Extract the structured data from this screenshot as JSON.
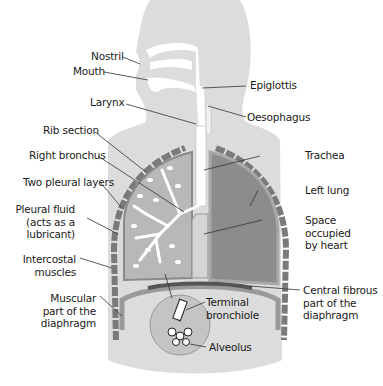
{
  "diagram": {
    "colors": {
      "body_silhouette": "#dcdcdc",
      "airway": "#ffffff",
      "right_lung_tissue": "#b8b8b8",
      "left_lung": "#8c8c8c",
      "pleura": "#a8a8a8",
      "rib": "#7a7a7a",
      "diaphragm_muscle": "#9a9a9a",
      "diaphragm_central": "#555555",
      "alveolus_circle": "#c4c4c4",
      "text": "#1a1a1a",
      "leader_line": "#333333"
    },
    "labels": {
      "nostril": "Nostril",
      "mouth": "Mouth",
      "epiglottis": "Epiglottis",
      "larynx": "Larynx",
      "oesophagus": "Oesophagus",
      "rib_section": "Rib section",
      "trachea": "Trachea",
      "right_bronchus": "Right bronchus",
      "two_pleural_layers": "Two pleural layers",
      "left_lung": "Left lung",
      "pleural_fluid_1": "Pleural fluid",
      "pleural_fluid_2": "(acts as a",
      "pleural_fluid_3": "lubricant)",
      "space_heart_1": "Space",
      "space_heart_2": "occupied",
      "space_heart_3": "by heart",
      "intercostal_1": "Intercostal",
      "intercostal_2": "muscles",
      "muscular_diaphragm_1": "Muscular",
      "muscular_diaphragm_2": "part of the",
      "muscular_diaphragm_3": "diaphragm",
      "central_fibrous_1": "Central fibrous",
      "central_fibrous_2": "part of the",
      "central_fibrous_3": "diaphragm",
      "terminal_bronchiole_1": "Terminal",
      "terminal_bronchiole_2": "bronchiole",
      "alveolus": "Alveolus"
    }
  }
}
